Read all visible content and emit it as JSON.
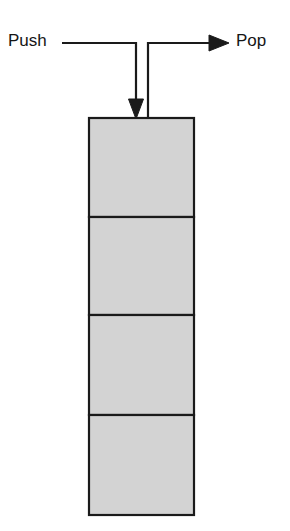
{
  "diagram": {
    "type": "stack-diagram",
    "labels": {
      "push": "Push",
      "pop": "Pop"
    },
    "colors": {
      "cell_fill": "#d3d3d3",
      "stroke": "#1a1a1a",
      "text": "#151515",
      "background": "#ffffff"
    },
    "stack": {
      "cell_count": 4,
      "cells": [
        {
          "label": ""
        },
        {
          "label": ""
        },
        {
          "label": ""
        },
        {
          "label": ""
        }
      ],
      "geometry": {
        "x": 89,
        "y": 118,
        "width": 105,
        "height": 397,
        "dividers_y": [
          217,
          315,
          415
        ]
      }
    },
    "arrows": {
      "push": {
        "name": "push-arrow",
        "direction": "down-into-stack",
        "start_x": 62,
        "line_y": 43,
        "turn_x": 136,
        "end_y": 118
      },
      "pop": {
        "name": "pop-arrow",
        "direction": "right-out-of-stack",
        "start_x": 148,
        "start_y": 118,
        "line_y": 43,
        "end_x": 228
      }
    }
  }
}
